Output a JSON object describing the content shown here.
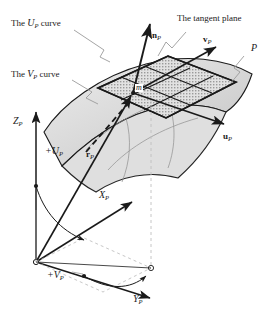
{
  "figure": {
    "type": "differential-geometry-diagram",
    "background_color": "#ffffff",
    "ink_color": "#1a1a1a",
    "surface_fill": "#d9d9d9",
    "tangent_plane_fill": "#bfbfbf",
    "leader_color": "#8a8a8a",
    "dashed_color": "#b9b9b9"
  },
  "annotations": {
    "u_curve": {
      "text": "The ",
      "sym": "U",
      "sub": "P",
      "tail": " curve"
    },
    "v_curve": {
      "text": "The ",
      "sym": "V",
      "sub": "P",
      "tail": " curve"
    },
    "tangent_plane": {
      "text": "The tangent plane"
    }
  },
  "vectors": {
    "normal": {
      "sym": "n",
      "sub": "P"
    },
    "tangent_v": {
      "sym": "v",
      "sub": "P"
    },
    "tangent_u": {
      "sym": "u",
      "sub": "P"
    },
    "position": {
      "sym": "r",
      "sub": "P"
    }
  },
  "points": {
    "surface_point": {
      "sym": "m"
    },
    "patch": {
      "sym": "P"
    }
  },
  "axes": {
    "x": {
      "sym": "X",
      "sub": "P"
    },
    "y": {
      "sym": "Y",
      "sub": "P"
    },
    "z": {
      "sym": "Z",
      "sub": "P"
    }
  },
  "parameters": {
    "u_angle": {
      "sym": "+U",
      "sub": "P"
    },
    "v_angle": {
      "sym": "+V",
      "sub": "P"
    }
  }
}
